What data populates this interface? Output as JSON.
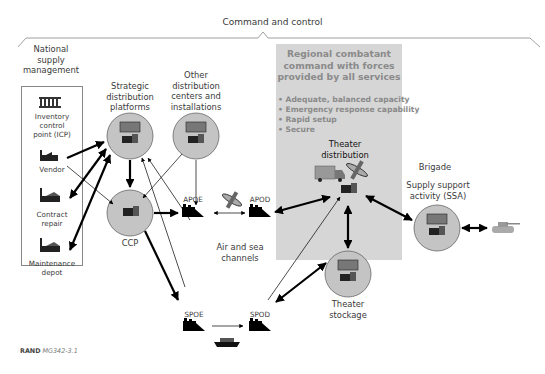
{
  "header": {
    "title": "Command and control"
  },
  "national_supply": {
    "heading": [
      "National",
      "supply",
      "management"
    ],
    "items": [
      {
        "label": [
          "Inventory",
          "control",
          "point (ICP)"
        ],
        "icon": "government-building-icon"
      },
      {
        "label": [
          "Vendor"
        ],
        "icon": "factory-icon"
      },
      {
        "label": [
          "Contract",
          "repair"
        ],
        "icon": "factory-icon"
      },
      {
        "label": [
          "Maintenance",
          "depot"
        ],
        "icon": "factory-icon"
      }
    ]
  },
  "nodes": {
    "strategic": {
      "label": [
        "Strategic",
        "distribution",
        "platforms"
      ],
      "icon": "warehouse-forklift-icon"
    },
    "other": {
      "label": [
        "Other",
        "distribution",
        "centers and",
        "installations"
      ],
      "icon": "warehouse-forklift-icon"
    },
    "ccp": {
      "label": "CCP",
      "icon": "forklift-icon"
    },
    "apoe": {
      "label": "APOE",
      "icon": "port-icon"
    },
    "apod": {
      "label": "APOD",
      "icon": "port-icon"
    },
    "spoe": {
      "label": "SPOE",
      "icon": "port-icon"
    },
    "spod": {
      "label": "SPOD",
      "icon": "port-icon"
    },
    "air_sea": {
      "label": [
        "Air and sea",
        "channels"
      ]
    },
    "theater_distribution": {
      "label": [
        "Theater",
        "distribution"
      ],
      "icons": [
        "truck-icon",
        "airplane-icon",
        "forklift-icon"
      ]
    },
    "theater_stockage": {
      "label": [
        "Theater",
        "stockage"
      ],
      "icon": "warehouse-forklift-icon"
    },
    "brigade": {
      "label": "Brigade"
    },
    "ssa": {
      "label": [
        "Supply support",
        "activity (SSA)"
      ],
      "icon": "warehouse-forklift-icon"
    },
    "tank": {
      "icon": "tank-icon"
    },
    "ship": {
      "icon": "ship-icon"
    },
    "plane": {
      "icon": "airplane-icon"
    }
  },
  "region": {
    "title": [
      "Regional combatant",
      "command with forces",
      "provided by all services"
    ],
    "bullets": [
      "Adequate, balanced capacity",
      "Emergency response capability",
      "Rapid setup",
      "Secure"
    ]
  },
  "edges": [
    {
      "from": "Vendor",
      "to": "Strategic distribution platforms",
      "style": "thick",
      "dir": "one-way"
    },
    {
      "from": "Strategic distribution platforms",
      "to": "Contract repair",
      "style": "thick",
      "dir": "two-way"
    },
    {
      "from": "Strategic distribution platforms",
      "to": "Maintenance depot",
      "style": "thick",
      "dir": "two-way"
    },
    {
      "from": "Vendor",
      "to": "CCP",
      "style": "thin",
      "dir": "one-way"
    },
    {
      "from": "Strategic distribution platforms",
      "to": "CCP",
      "style": "thick",
      "dir": "one-way"
    },
    {
      "from": "Other distribution centers",
      "to": "CCP",
      "style": "thin",
      "dir": "one-way"
    },
    {
      "from": "Other distribution centers",
      "to": "APOE",
      "style": "thin",
      "dir": "one-way"
    },
    {
      "from": "CCP",
      "to": "APOE",
      "style": "thick",
      "dir": "one-way"
    },
    {
      "from": "CCP",
      "to": "SPOE",
      "style": "thick",
      "dir": "one-way"
    },
    {
      "from": "APOE",
      "to": "APOD",
      "style": "thin",
      "dir": "two-way"
    },
    {
      "from": "SPOE",
      "to": "SPOD",
      "style": "thin",
      "dir": "one-way"
    },
    {
      "from": "Theater distribution",
      "to": "APOD",
      "style": "thick",
      "dir": "two-way"
    },
    {
      "from": "Theater distribution",
      "to": "Theater stockage",
      "style": "thick",
      "dir": "two-way"
    },
    {
      "from": "Theater distribution",
      "to": "SSA",
      "style": "thick",
      "dir": "two-way"
    },
    {
      "from": "SPOD",
      "to": "Theater stockage",
      "style": "thick",
      "dir": "two-way"
    },
    {
      "from": "SPOD",
      "to": "Theater distribution",
      "style": "thin",
      "dir": "one-way"
    },
    {
      "from": "SPOE",
      "to": "Strategic distribution platforms",
      "style": "thin",
      "dir": "one-way"
    },
    {
      "from": "APOE",
      "to": "Strategic distribution platforms",
      "style": "thin",
      "dir": "one-way"
    },
    {
      "from": "SSA",
      "to": "Tank",
      "style": "thick",
      "dir": "two-way"
    }
  ],
  "colors": {
    "circle_fill": "#c4c4c4",
    "region_fill": "#d6d6d6",
    "region_text": "#8a8a8a",
    "line": "#000000"
  },
  "footer": {
    "source": "RAND",
    "id": "MG342-3.1"
  }
}
